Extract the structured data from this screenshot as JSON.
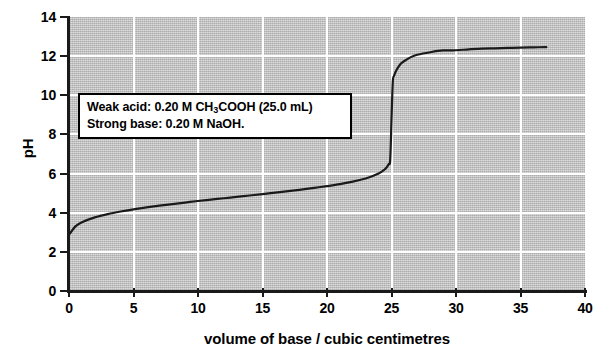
{
  "chart_data": {
    "type": "line",
    "title": "",
    "xlabel": "volume of base / cubic centimetres",
    "ylabel": "pH",
    "xlim": [
      0,
      40
    ],
    "ylim": [
      0,
      14
    ],
    "xticks": [
      0,
      5,
      10,
      15,
      20,
      25,
      30,
      35,
      40
    ],
    "yticks": [
      0,
      2,
      4,
      6,
      8,
      10,
      12,
      14
    ],
    "grid": true,
    "legend": null,
    "series": [
      {
        "name": "titration curve",
        "x": [
          0,
          0.5,
          1,
          2,
          3,
          4,
          5,
          6,
          7,
          8,
          9,
          10,
          11,
          12,
          13,
          14,
          15,
          16,
          17,
          18,
          19,
          20,
          21,
          22,
          23,
          23.5,
          24,
          24.3,
          24.6,
          24.8,
          24.9,
          25,
          25.1,
          25.2,
          25.4,
          25.7,
          26,
          26.5,
          27,
          28,
          29,
          30,
          31,
          32,
          33,
          34,
          35,
          36,
          37
        ],
        "y": [
          2.87,
          3.3,
          3.51,
          3.76,
          3.93,
          4.06,
          4.17,
          4.27,
          4.36,
          4.44,
          4.52,
          4.6,
          4.67,
          4.74,
          4.81,
          4.88,
          4.95,
          5.03,
          5.1,
          5.18,
          5.27,
          5.36,
          5.46,
          5.59,
          5.75,
          5.86,
          6.0,
          6.12,
          6.3,
          6.5,
          6.7,
          8.72,
          10.7,
          11.0,
          11.3,
          11.6,
          11.75,
          11.95,
          12.07,
          12.2,
          12.29,
          12.3,
          12.35,
          12.38,
          12.4,
          12.42,
          12.44,
          12.45,
          12.46
        ]
      }
    ],
    "annotations": [
      {
        "name": "conditions-box",
        "lines": [
          {
            "pre": "Weak acid:  0.20 M CH",
            "sub": "3",
            "post": "COOH  (25.0 mL)"
          },
          {
            "pre": "Strong base: 0.20 M NaOH.",
            "sub": "",
            "post": ""
          }
        ]
      }
    ],
    "colors": {
      "plot_background": "#b9b9b9",
      "gridline": "#ffffff",
      "curve": "#1a1a1a",
      "axis": "#1a1a1a",
      "annotation_background": "#ffffff",
      "annotation_border": "#000000",
      "page_background": "#ffffff"
    }
  }
}
